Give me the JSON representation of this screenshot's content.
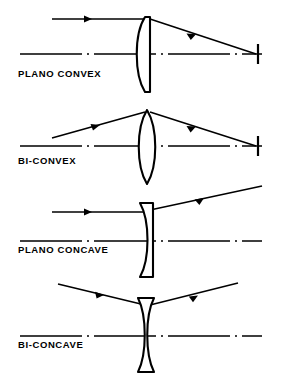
{
  "figure": {
    "background_color": "#ffffff",
    "stroke_color": "#000000",
    "width": 282,
    "height": 390
  },
  "panels": [
    {
      "id": "plano-convex",
      "label": "PLANO CONVEX",
      "lens_shape": "plano-convex",
      "curved_side": "left",
      "flat_side": "right",
      "behavior": "converging",
      "ray_in": "horizontal",
      "ray_out": "converges-down-to-focal-point",
      "has_focal_tick": true,
      "label_x": 18,
      "label_y": 77,
      "axis_y": 54,
      "lens_center_x": 146,
      "lens_top_y": 17,
      "lens_bottom_y": 92,
      "lens_half_width": 9,
      "ray_in_y": 19,
      "ray_in_x_start": 52,
      "focal_x": 258,
      "focal_y": 54
    },
    {
      "id": "bi-convex",
      "label": "BI-CONVEX",
      "lens_shape": "bi-convex",
      "curved_side": "both",
      "flat_side": "none",
      "behavior": "converging",
      "ray_in": "angled-down",
      "ray_out": "converges-down-to-focal-point",
      "has_focal_tick": true,
      "label_x": 18,
      "label_y": 164,
      "axis_y": 146,
      "lens_center_x": 146,
      "lens_top_y": 110,
      "lens_bottom_y": 184,
      "lens_half_width": 9,
      "ray_in_y": 138,
      "ray_in_x_start": 52,
      "focal_x": 258,
      "focal_y": 146
    },
    {
      "id": "plano-concave",
      "label": "PLANO CONCAVE",
      "lens_shape": "plano-concave",
      "curved_side": "left",
      "flat_side": "right",
      "behavior": "diverging",
      "ray_in": "horizontal",
      "ray_out": "diverges-upward",
      "has_focal_tick": false,
      "label_x": 18,
      "label_y": 253,
      "axis_y": 241,
      "lens_center_x": 146,
      "lens_top_y": 203,
      "lens_bottom_y": 277,
      "lens_half_width": 8,
      "ray_in_y": 212,
      "ray_in_x_start": 52,
      "ray_out_x_end": 262,
      "ray_out_y_end": 186
    },
    {
      "id": "bi-concave",
      "label": "BI-CONCAVE",
      "lens_shape": "bi-concave",
      "curved_side": "both",
      "flat_side": "none",
      "behavior": "diverging",
      "ray_in": "angled-down",
      "ray_out": "diverges-upward",
      "has_focal_tick": false,
      "label_x": 18,
      "label_y": 348,
      "axis_y": 336,
      "lens_center_x": 146,
      "lens_top_y": 298,
      "lens_bottom_y": 372,
      "lens_half_width": 8,
      "ray_in_y": 284,
      "ray_in_x_start": 58,
      "ray_out_x_end": 232,
      "ray_out_y_end": 284
    }
  ]
}
